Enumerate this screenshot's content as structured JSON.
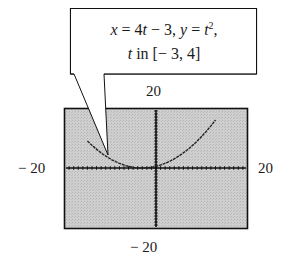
{
  "callout": {
    "x_var": "x",
    "eq1": " = 4",
    "t1": "t",
    "eq1b": " − 3,  ",
    "y_var": "y",
    "eq2": " = ",
    "t2": "t",
    "sup": "2",
    "eq2b": ",",
    "t3": "t",
    "range": " in [− 3, 4]"
  },
  "axis_labels": {
    "ymax": "20",
    "ymin": "− 20",
    "xmin": "− 20",
    "xmax": "20"
  },
  "colors": {
    "screen_bg": "#c8c8c8",
    "axis": "#111111",
    "curve": "#222222",
    "frame": "#111111"
  },
  "chart_data": {
    "type": "line",
    "xlabel": "",
    "ylabel": "",
    "xlim": [
      -20,
      20
    ],
    "ylim": [
      -20,
      20
    ],
    "grid": false,
    "tick_labels": {
      "xmin": "−20",
      "xmax": "20",
      "ymin": "−20",
      "ymax": "20"
    },
    "series": [
      {
        "name": "parametric curve",
        "t": [
          -3,
          -2.5,
          -2,
          -1.5,
          -1,
          -0.5,
          0,
          0.5,
          1,
          1.5,
          2,
          2.5,
          3,
          3.5,
          4
        ],
        "x": [
          -15,
          -13,
          -11,
          -9,
          -7,
          -5,
          -3,
          -1,
          1,
          3,
          5,
          7,
          9,
          11,
          13
        ],
        "y": [
          9,
          6.25,
          4,
          2.25,
          1,
          0.25,
          0,
          0.25,
          1,
          2.25,
          4,
          6.25,
          9,
          12.25,
          16
        ]
      }
    ]
  }
}
